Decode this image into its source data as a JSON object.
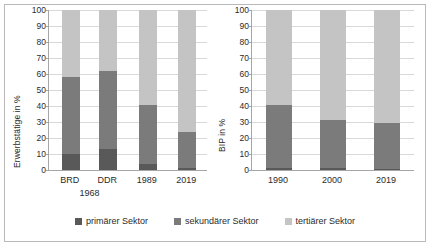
{
  "legend": {
    "items": [
      {
        "label": "primärer Sektor",
        "color": "#595959"
      },
      {
        "label": "sekundärer Sektor",
        "color": "#7b7b7b"
      },
      {
        "label": "tertiärer Sektor",
        "color": "#c4c4c4"
      }
    ]
  },
  "colors": {
    "primary": "#595959",
    "secondary": "#7b7b7b",
    "tertiary": "#c4c4c4",
    "grid": "#d9d9d9",
    "axis": "#a6a6a6",
    "frame": "#b9b9b9",
    "text": "#2b2b2b"
  },
  "chart_data": [
    {
      "type": "bar",
      "id": "erwerbstaetige",
      "title": "",
      "xlabel": "",
      "ylabel": "Erwerbstätige in %",
      "ylim": [
        0,
        100
      ],
      "yticks": [
        0,
        10,
        20,
        30,
        40,
        50,
        60,
        70,
        80,
        90,
        100
      ],
      "ytick_labels": [
        "0",
        "10",
        "20",
        "30",
        "40",
        "50",
        "60",
        "70",
        "80",
        "90",
        "100"
      ],
      "grid": true,
      "stacked": true,
      "categories": [
        "BRD",
        "DDR",
        "1989",
        "2019"
      ],
      "category_sublabels": [
        "1968",
        "1968",
        "",
        ""
      ],
      "sublabel_text": "1968",
      "series": [
        {
          "name": "primärer Sektor",
          "values": [
            10.0,
            13.0,
            3.5,
            1.0
          ]
        },
        {
          "name": "sekundärer Sektor",
          "values": [
            48.0,
            49.0,
            37.0,
            23.0
          ]
        },
        {
          "name": "tertiärer Sektor",
          "values": [
            42.0,
            38.0,
            59.5,
            76.0
          ]
        }
      ],
      "cumulative_tops": {
        "primary": [
          10.0,
          13.0,
          3.5,
          1.0
        ],
        "secondary": [
          58.0,
          62.0,
          40.5,
          24.0
        ],
        "tertiary": [
          100,
          100,
          100,
          100
        ]
      }
    },
    {
      "type": "bar",
      "id": "bip",
      "title": "",
      "xlabel": "",
      "ylabel": "BIP in %",
      "ylim": [
        0,
        100
      ],
      "yticks": [
        0,
        10,
        20,
        30,
        40,
        50,
        60,
        70,
        80,
        90,
        100
      ],
      "ytick_labels": [
        "0",
        "10",
        "20",
        "30",
        "40",
        "50",
        "60",
        "70",
        "80",
        "90",
        "100"
      ],
      "grid": true,
      "stacked": true,
      "categories": [
        "1990",
        "2000",
        "2019"
      ],
      "series": [
        {
          "name": "primärer Sektor",
          "values": [
            1.0,
            1.0,
            0.8
          ]
        },
        {
          "name": "sekundärer Sektor",
          "values": [
            39.5,
            30.0,
            28.7
          ]
        },
        {
          "name": "tertiärer Sektor",
          "values": [
            59.5,
            69.0,
            70.5
          ]
        }
      ],
      "cumulative_tops": {
        "primary": [
          1.0,
          1.0,
          0.8
        ],
        "secondary": [
          40.5,
          31.0,
          29.5
        ],
        "tertiary": [
          100,
          100,
          100
        ]
      }
    }
  ]
}
